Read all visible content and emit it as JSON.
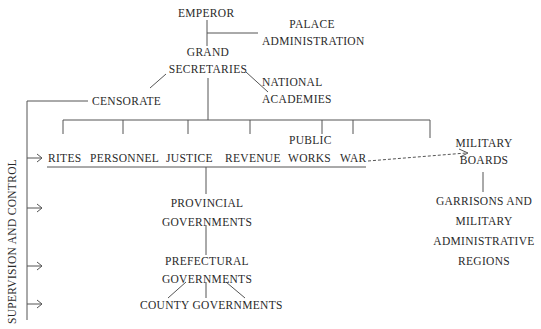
{
  "diagram": {
    "nodes": {
      "emperor": "EMPEROR",
      "palace_admin": [
        "PALACE",
        "ADMINISTRATION"
      ],
      "grand_secretaries": [
        "GRAND",
        "SECRETARIES"
      ],
      "national_academies": [
        "NATIONAL",
        "ACADEMIES"
      ],
      "censorate": "CENSORATE",
      "ministries": [
        "RITES",
        "PERSONNEL",
        "JUSTICE",
        "REVENUE",
        "PUBLIC",
        "WORKS",
        "WAR"
      ],
      "military_boards": [
        "MILITARY",
        "BOARDS"
      ],
      "garrisons": [
        "GARRISONS AND",
        "MILITARY",
        "ADMINISTRATIVE",
        "REGIONS"
      ],
      "provincial": [
        "PROVINCIAL",
        "GOVERNMENTS"
      ],
      "prefectural": [
        "PREFECTURAL",
        "GOVERNMENTS"
      ],
      "county": "COUNTY GOVERNMENTS"
    },
    "side_label": "SUPERVISION AND CONTROL",
    "line_color": "#555555",
    "text_color": "#2a2a2a"
  }
}
